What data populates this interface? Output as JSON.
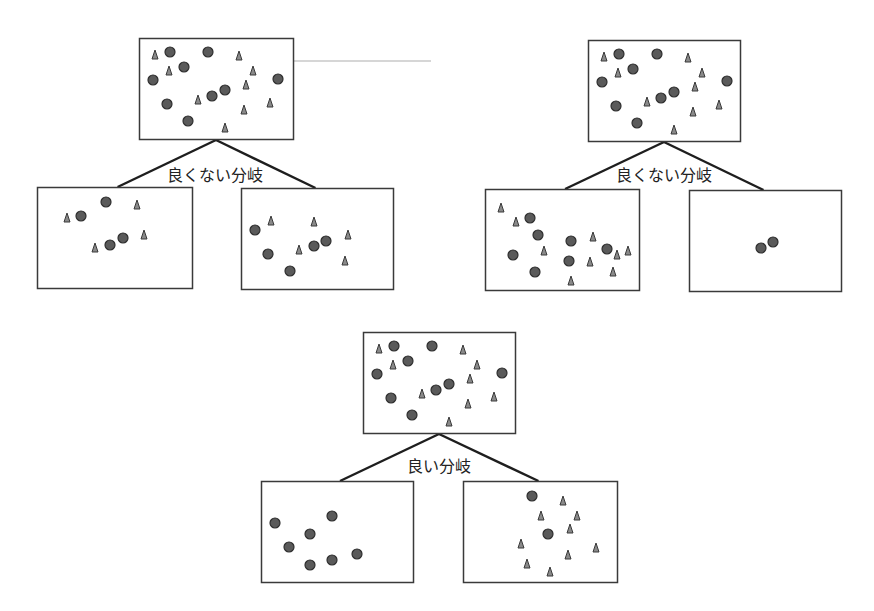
{
  "colors": {
    "box_stroke": "#3a3a3a",
    "circle_fill": "#5a5a5a",
    "circle_stroke": "#2e2e2e",
    "triangle_fill": "#8a8a8a",
    "triangle_stroke": "#3a3a3a",
    "branch_line": "#1e1e1e",
    "stray_line": "#c8c8c8"
  },
  "stray_line": {
    "x1": 277,
    "y1": 61,
    "x2": 431,
    "y2": 61
  },
  "parent_points": {
    "circles": [
      [
        31,
        14
      ],
      [
        69,
        14
      ],
      [
        45,
        29
      ],
      [
        14,
        42
      ],
      [
        139,
        41
      ],
      [
        86,
        52
      ],
      [
        73,
        58
      ],
      [
        28,
        66
      ],
      [
        49,
        83
      ]
    ],
    "triangles": [
      [
        16,
        17
      ],
      [
        100,
        18
      ],
      [
        30,
        33
      ],
      [
        114,
        33
      ],
      [
        107,
        47
      ],
      [
        59,
        62
      ],
      [
        131,
        65
      ],
      [
        105,
        72
      ],
      [
        86,
        90
      ]
    ]
  },
  "splits": [
    {
      "id": "bad-split-1",
      "label": "良くない分岐",
      "label_pos": [
        215,
        172
      ],
      "parent": {
        "x": 139,
        "y": 38,
        "w": 154,
        "h": 101
      },
      "children": [
        {
          "x": 37,
          "y": 187,
          "w": 155,
          "h": 101,
          "circles": [
            [
              106,
              202
            ],
            [
              81,
              216
            ],
            [
              123,
              238
            ],
            [
              110,
              245
            ]
          ],
          "triangles": [
            [
              137,
              205
            ],
            [
              67,
              218
            ],
            [
              144,
              235
            ],
            [
              95,
              248
            ]
          ]
        },
        {
          "x": 241,
          "y": 188,
          "w": 152,
          "h": 101,
          "circles": [
            [
              255,
              230
            ],
            [
              326,
              241
            ],
            [
              314,
              246
            ],
            [
              268,
              254
            ],
            [
              290,
              271
            ]
          ],
          "triangles": [
            [
              271,
              221
            ],
            [
              314,
              222
            ],
            [
              348,
              235
            ],
            [
              299,
              250
            ],
            [
              345,
              261
            ]
          ]
        }
      ]
    },
    {
      "id": "bad-split-2",
      "label": "良くない分岐",
      "label_pos": [
        664,
        172
      ],
      "parent": {
        "x": 588,
        "y": 40,
        "w": 152,
        "h": 101
      },
      "children": [
        {
          "x": 485,
          "y": 189,
          "w": 154,
          "h": 101,
          "circles": [
            [
              530,
              218
            ],
            [
              538,
              235
            ],
            [
              571,
              241
            ],
            [
              607,
              249
            ],
            [
              513,
              255
            ],
            [
              569,
              261
            ],
            [
              535,
              272
            ]
          ],
          "triangles": [
            [
              501,
              208
            ],
            [
              516,
              222
            ],
            [
              544,
              251
            ],
            [
              593,
              237
            ],
            [
              628,
              251
            ],
            [
              617,
              255
            ],
            [
              590,
              262
            ],
            [
              613,
              272
            ],
            [
              571,
              281
            ]
          ]
        },
        {
          "x": 689,
          "y": 190,
          "w": 152,
          "h": 101,
          "circles": [
            [
              773,
              242
            ],
            [
              761,
              248
            ]
          ],
          "triangles": []
        }
      ]
    },
    {
      "id": "good-split",
      "label": "良い分岐",
      "label_pos": [
        439,
        463
      ],
      "parent": {
        "x": 363,
        "y": 332,
        "w": 152,
        "h": 101
      },
      "children": [
        {
          "x": 261,
          "y": 481,
          "w": 152,
          "h": 101,
          "circles": [
            [
              332,
              516
            ],
            [
              275,
              523
            ],
            [
              310,
              534
            ],
            [
              289,
              547
            ],
            [
              357,
              554
            ],
            [
              332,
              560
            ],
            [
              310,
              565
            ]
          ],
          "triangles": []
        },
        {
          "x": 463,
          "y": 481,
          "w": 154,
          "h": 101,
          "circles": [
            [
              532,
              496
            ],
            [
              548,
              534
            ]
          ],
          "triangles": [
            [
              563,
              501
            ],
            [
              541,
              516
            ],
            [
              577,
              516
            ],
            [
              570,
              529
            ],
            [
              521,
              544
            ],
            [
              596,
              548
            ],
            [
              568,
              555
            ],
            [
              527,
              564
            ],
            [
              550,
              572
            ]
          ]
        }
      ]
    }
  ]
}
